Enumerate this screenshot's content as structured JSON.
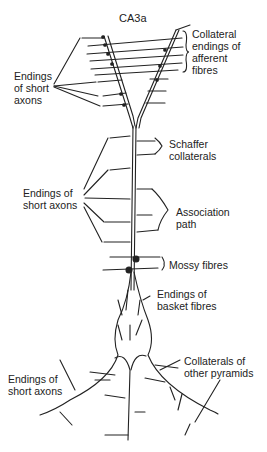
{
  "title": "CA3a",
  "labels": {
    "collateral_afferent": "Collateral\nendings of\nafferent\nfibres",
    "short_axons_top": "Endings\nof short\naxons",
    "schaffer": "Schaffer\ncollaterals",
    "short_axons_mid": "Endings of\nshort axons",
    "association": "Association\npath",
    "mossy": "Mossy fibres",
    "basket": "Endings of\nbasket fibres",
    "collaterals_pyramids": "Collaterals of\nother pyramids",
    "short_axons_bottom": "Endings of\nshort axons"
  },
  "colors": {
    "ink": "#222222",
    "background": "#ffffff"
  }
}
